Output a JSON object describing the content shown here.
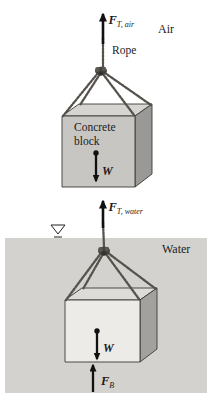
{
  "figure": {
    "air_scene": {
      "medium": "Air",
      "tension_force": "F",
      "tension_sub": "T, air",
      "rope_label": "Rope",
      "block_line1": "Concrete",
      "block_line2": "block",
      "weight": "W"
    },
    "water_scene": {
      "medium": "Water",
      "tension_force": "F",
      "tension_sub": "T, water",
      "weight": "W",
      "buoyancy_force": "F",
      "buoyancy_sub": "B"
    },
    "colors": {
      "air_block_front": "#c7c6c2",
      "air_block_top": "#d6d5d1",
      "air_block_side": "#999997",
      "water_fill": "#d3d2ce",
      "water_block_front": "#edebe7",
      "water_block_top": "#dddcd8",
      "water_block_side": "#a2a19d"
    }
  }
}
